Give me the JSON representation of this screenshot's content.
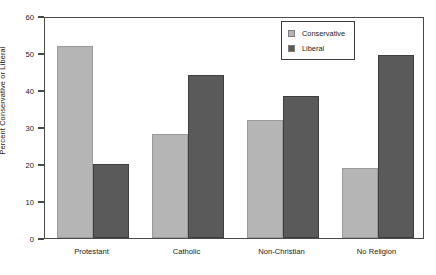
{
  "chart_data": {
    "type": "bar",
    "title": "",
    "xlabel": "",
    "ylabel": "Percent Conservative or Liberal",
    "ylim": [
      0,
      60
    ],
    "yticks": [
      0,
      10,
      20,
      30,
      40,
      50,
      60
    ],
    "grid": false,
    "legend_position": "top-right",
    "categories": [
      "Protestant",
      "Catholic",
      "Non-Christian",
      "No Religion"
    ],
    "series": [
      {
        "name": "Conservative",
        "color": "#b5b5b5",
        "values": [
          52,
          28,
          32,
          19
        ]
      },
      {
        "name": "Liberal",
        "color": "#5a5a5a",
        "values": [
          20,
          44,
          38.5,
          49.5
        ]
      }
    ]
  },
  "legend": {
    "items": [
      {
        "label": "Conservative",
        "swatch": "#b5b5b5"
      },
      {
        "label": "Liberal",
        "swatch": "#5a5a5a"
      }
    ]
  },
  "colors": {
    "conservative": "#b5b5b5",
    "liberal": "#5a5a5a",
    "axis": "#4a4a4a",
    "text": "#1a1a1a",
    "background": "#ffffff"
  }
}
